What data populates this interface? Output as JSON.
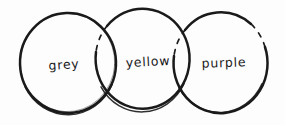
{
  "figure": {
    "ink_color": "#1a1a1a",
    "background_color": "#fdfdfd",
    "circles": [
      {
        "label": "grey"
      },
      {
        "label": "yellow"
      },
      {
        "label": "purple"
      }
    ]
  }
}
